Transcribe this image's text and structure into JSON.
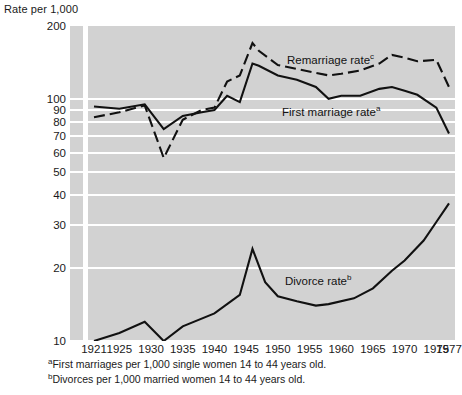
{
  "chart_data": {
    "type": "line",
    "title": "",
    "ylabel": "Rate per 1,000",
    "xlabel": "",
    "yscale": "log",
    "ylim": [
      10,
      200
    ],
    "grid": true,
    "legend": "inline-annotations",
    "yticks": [
      {
        "value": 200,
        "label": "200"
      },
      {
        "value": 100,
        "label": "100"
      },
      {
        "value": 90,
        "label": "90"
      },
      {
        "value": 80,
        "label": "80"
      },
      {
        "value": 70,
        "label": "70"
      },
      {
        "value": 60,
        "label": "60"
      },
      {
        "value": 50,
        "label": "50"
      },
      {
        "value": 40,
        "label": "40"
      },
      {
        "value": 30,
        "label": "30"
      },
      {
        "value": 20,
        "label": "20"
      },
      {
        "value": 10,
        "label": "10"
      }
    ],
    "xticks": [
      {
        "value": 1921,
        "label": "1921"
      },
      {
        "value": 1925,
        "label": "1925"
      },
      {
        "value": 1930,
        "label": "1930"
      },
      {
        "value": 1935,
        "label": "1935"
      },
      {
        "value": 1940,
        "label": "1940"
      },
      {
        "value": 1945,
        "label": "1945"
      },
      {
        "value": 1950,
        "label": "1950"
      },
      {
        "value": 1955,
        "label": "1955"
      },
      {
        "value": 1960,
        "label": "1960"
      },
      {
        "value": 1965,
        "label": "1965"
      },
      {
        "value": 1970,
        "label": "1970"
      },
      {
        "value": 1975,
        "label": "1975"
      },
      {
        "value": 1977,
        "label": "1977"
      }
    ],
    "xlim": [
      1921,
      1977
    ],
    "series": [
      {
        "name": "First marriage rate",
        "label": "First marriage rate",
        "footnote_marker": "a",
        "style": "solid",
        "color": "#111111",
        "x": [
          1921,
          1925,
          1929,
          1932,
          1935,
          1938,
          1940,
          1942,
          1944,
          1946,
          1947,
          1950,
          1953,
          1956,
          1958,
          1960,
          1963,
          1966,
          1968,
          1970,
          1972,
          1975,
          1977
        ],
        "values": [
          93,
          91,
          95,
          75,
          85,
          88,
          90,
          103,
          97,
          140,
          137,
          125,
          120,
          112,
          100,
          103,
          103,
          110,
          112,
          108,
          104,
          92,
          72
        ]
      },
      {
        "name": "Remarriage rate",
        "label": "Remarriage rate",
        "footnote_marker": "c",
        "style": "dashed",
        "color": "#111111",
        "x": [
          1921,
          1925,
          1929,
          1932,
          1935,
          1938,
          1940,
          1942,
          1944,
          1946,
          1947,
          1950,
          1953,
          1956,
          1958,
          1960,
          1963,
          1966,
          1968,
          1970,
          1972,
          1975,
          1977
        ],
        "values": [
          84,
          88,
          94,
          57,
          82,
          90,
          92,
          118,
          125,
          170,
          158,
          138,
          133,
          128,
          125,
          127,
          131,
          140,
          152,
          148,
          143,
          145,
          112
        ]
      },
      {
        "name": "Divorce rate",
        "label": "Divorce rate",
        "footnote_marker": "b",
        "style": "solid",
        "color": "#111111",
        "x": [
          1921,
          1925,
          1929,
          1932,
          1935,
          1940,
          1944,
          1946,
          1948,
          1950,
          1953,
          1956,
          1958,
          1962,
          1965,
          1968,
          1970,
          1973,
          1975,
          1977
        ],
        "values": [
          10.0,
          10.8,
          12.0,
          10.0,
          11.5,
          13.0,
          15.5,
          24.0,
          17.5,
          15.3,
          14.6,
          14.0,
          14.2,
          15.0,
          16.5,
          19.5,
          21.5,
          26.0,
          31.0,
          37.0
        ]
      }
    ],
    "footnotes": [
      {
        "marker": "a",
        "text": "First marriages per 1,000 single women 14 to 44 years old."
      },
      {
        "marker": "b",
        "text": "Divorces per 1,000 married women 14 to 44 years old."
      }
    ]
  }
}
